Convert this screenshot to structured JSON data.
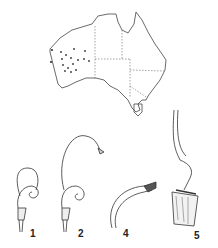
{
  "figure": {
    "map": {
      "region": "Australia",
      "state_borders": "dashed",
      "occurrence_points": "Western Australia interior"
    },
    "panels": [
      {
        "label": "1",
        "subject": "flower with hood loop"
      },
      {
        "label": "2",
        "subject": "flower with long curved stalk"
      },
      {
        "label": "4",
        "subject": "curved tube tip detail"
      },
      {
        "label": "5",
        "subject": "column detail with hairy base"
      }
    ]
  }
}
